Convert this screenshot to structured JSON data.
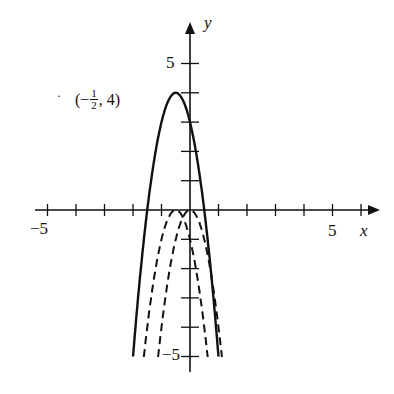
{
  "chart_data": {
    "type": "line",
    "title": "",
    "xlabel": "x",
    "ylabel": "y",
    "xlim": [
      -5.5,
      6.5
    ],
    "ylim": [
      -5,
      5.8
    ],
    "x_tick_labels": [
      "-5",
      "5"
    ],
    "y_tick_labels": [
      "5",
      "-5"
    ],
    "annotation": "(-1/2, 4)",
    "series": [
      {
        "name": "y = -4(x + 1/2)^2 + 4",
        "style": "solid",
        "vertex": [
          -0.5,
          4
        ],
        "x_range": [
          -2,
          1
        ]
      },
      {
        "name": "y = -4(x + 1/2)^2",
        "style": "dashed",
        "vertex": [
          -0.5,
          0
        ],
        "x_range": [
          -1.62,
          0.62
        ]
      },
      {
        "name": "y = -4x^2",
        "style": "dashed",
        "vertex": [
          0,
          0
        ],
        "x_range": [
          -1.12,
          1.12
        ]
      }
    ]
  },
  "labels": {
    "x_axis": "x",
    "y_axis": "y",
    "x_min": "−5",
    "x_max": "5",
    "y_max": "5",
    "y_min": "−5",
    "vertex_open": "(−",
    "frac_num": "1",
    "frac_den": "2",
    "vertex_close": ", 4)"
  }
}
